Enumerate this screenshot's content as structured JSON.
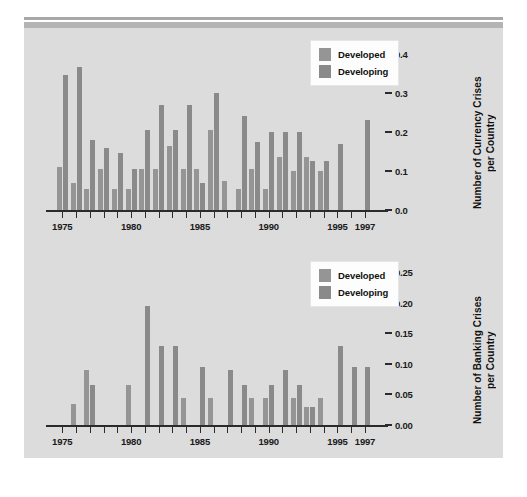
{
  "figure": {
    "background": "#dcdcdc",
    "page_background": "#ffffff",
    "rule_color": "#b4b4b4"
  },
  "colors": {
    "developed": "#959595",
    "developing": "#8a8a8a",
    "axis": "#2b2b2b",
    "text": "#111111"
  },
  "legend": {
    "developed_label": "Developed",
    "developing_label": "Developing"
  },
  "chart_data": [
    {
      "type": "bar",
      "id": "currency-crises",
      "title": "",
      "ylabel": "Number of Currency Crises\nper Country",
      "ylabel_line1": "Number of Currency Crises",
      "ylabel_line2": "per Country",
      "xlabel": "",
      "ylim": [
        0.0,
        0.42
      ],
      "ytick_values": [
        0.0,
        0.1,
        0.2,
        0.3,
        0.4
      ],
      "ytick_labels": [
        "0.0",
        "0.1",
        "0.2",
        "0.3",
        "0.4"
      ],
      "xlim": [
        1974.4,
        1997.8
      ],
      "x": [
        1975,
        1976,
        1977,
        1978,
        1979,
        1980,
        1981,
        1982,
        1983,
        1984,
        1985,
        1986,
        1987,
        1988,
        1989,
        1990,
        1991,
        1992,
        1993,
        1994,
        1995,
        1996,
        1997
      ],
      "xtick_labels": [
        "1975",
        "1980",
        "1985",
        "1990",
        "1995",
        "1997"
      ],
      "xtick_label_values": [
        1975,
        1980,
        1985,
        1990,
        1995,
        1997
      ],
      "grid": false,
      "legend_position": "upper right",
      "series": [
        {
          "name": "Developed",
          "values": [
            0.11,
            0.07,
            0.055,
            0.105,
            0.055,
            0.055,
            0.105,
            0.105,
            0.165,
            0.105,
            0.105,
            0.205,
            0.075,
            0.055,
            0.105,
            0.055,
            0.135,
            0.1,
            0.135,
            0.1,
            0.0,
            0.0,
            0.0
          ]
        },
        {
          "name": "Developing",
          "values": [
            0.345,
            0.365,
            0.18,
            0.16,
            0.145,
            0.105,
            0.205,
            0.27,
            0.205,
            0.27,
            0.07,
            0.3,
            0.0,
            0.24,
            0.175,
            0.2,
            0.2,
            0.2,
            0.125,
            0.125,
            0.17,
            0.0,
            0.23
          ]
        }
      ]
    },
    {
      "type": "bar",
      "id": "banking-crises",
      "title": "",
      "ylabel": "Number of Banking Crises\nper Country",
      "ylabel_line1": "Number of Banking Crises",
      "ylabel_line2": "per Country",
      "xlabel": "",
      "ylim": [
        0.0,
        0.265
      ],
      "ytick_values": [
        0.0,
        0.05,
        0.1,
        0.15,
        0.2,
        0.25
      ],
      "ytick_labels": [
        "0.00",
        "0.05",
        "0.10",
        "0.15",
        "0.20",
        "0.25"
      ],
      "xlim": [
        1974.4,
        1997.8
      ],
      "x": [
        1975,
        1976,
        1977,
        1978,
        1979,
        1980,
        1981,
        1982,
        1983,
        1984,
        1985,
        1986,
        1987,
        1988,
        1989,
        1990,
        1991,
        1992,
        1993,
        1994,
        1995,
        1996,
        1997
      ],
      "xtick_labels": [
        "1975",
        "1980",
        "1985",
        "1990",
        "1995",
        "1997"
      ],
      "xtick_label_values": [
        1975,
        1980,
        1985,
        1990,
        1995,
        1997
      ],
      "grid": false,
      "legend_position": "upper right",
      "series": [
        {
          "name": "Developed",
          "values": [
            0.0,
            0.035,
            0.09,
            0.0,
            0.0,
            0.065,
            0.0,
            0.0,
            0.0,
            0.045,
            0.0,
            0.045,
            0.0,
            0.0,
            0.045,
            0.045,
            0.0,
            0.045,
            0.03,
            0.045,
            0.0,
            0.0,
            0.0
          ]
        },
        {
          "name": "Developing",
          "values": [
            0.0,
            0.0,
            0.065,
            0.0,
            0.0,
            0.0,
            0.195,
            0.13,
            0.13,
            0.0,
            0.095,
            0.0,
            0.09,
            0.065,
            0.0,
            0.065,
            0.09,
            0.065,
            0.03,
            0.0,
            0.13,
            0.095,
            0.095
          ]
        }
      ]
    }
  ]
}
